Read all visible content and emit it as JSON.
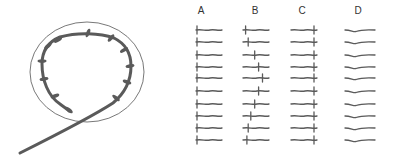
{
  "figure": {
    "left_panel": {
      "description": "Looped strand with side projections enclosed by a circle",
      "projection_count": 12
    },
    "right_panel": {
      "columns": [
        {
          "label": "A",
          "mark_position": "start",
          "rows": 10
        },
        {
          "label": "B",
          "mark_position": "varies",
          "rows": 10
        },
        {
          "label": "C",
          "mark_position": "end",
          "rows": 10
        },
        {
          "label": "D",
          "mark_position": "none",
          "rows": 10
        }
      ]
    }
  },
  "colors": {
    "ink": "#5a5a5a",
    "outline": "#555555",
    "label": "#333333",
    "background": "#ffffff"
  }
}
